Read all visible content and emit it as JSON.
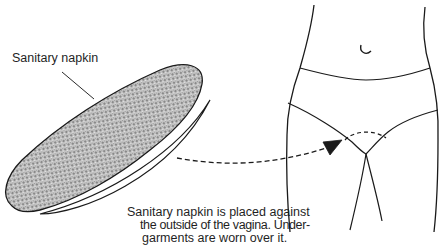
{
  "figure": {
    "labels": {
      "napkin": "Sanitary napkin"
    },
    "caption": {
      "lines": [
        "Sanitary napkin is placed against",
        "the outside of the vagina. Under-",
        "garments are worn over it."
      ]
    },
    "elements": {
      "napkin_fill_pattern": "crosshatch-stipple",
      "arrow_style": "dashed",
      "placement_marker_style": "dashed-arc"
    },
    "colors": {
      "line": "#1a1a1a",
      "napkin_fill": "#b9b9b9",
      "background": "#ffffff"
    }
  }
}
